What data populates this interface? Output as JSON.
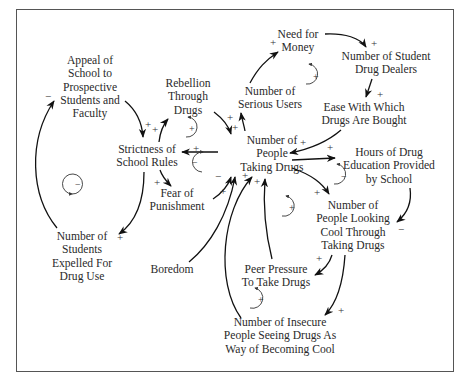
{
  "diagram": {
    "type": "causal-loop-diagram",
    "nodes": [
      {
        "id": "appeal",
        "lines": [
          "Appeal of",
          "School to",
          "Prospective",
          "Students and",
          "Faculty"
        ]
      },
      {
        "id": "strictness",
        "lines": [
          "Strictness of",
          "School Rules"
        ]
      },
      {
        "id": "rebellion",
        "lines": [
          "Rebellion",
          "Through",
          "Drugs"
        ]
      },
      {
        "id": "fear",
        "lines": [
          "Fear of",
          "Punishment"
        ]
      },
      {
        "id": "expelled",
        "lines": [
          "Number of",
          "Students",
          "Expelled For",
          "Drug Use"
        ]
      },
      {
        "id": "boredom",
        "lines": [
          "Boredom"
        ]
      },
      {
        "id": "people_taking",
        "lines": [
          "Number of",
          "People",
          "Taking Drugs"
        ]
      },
      {
        "id": "serious_users",
        "lines": [
          "Number of",
          "Serious Users"
        ]
      },
      {
        "id": "need_money",
        "lines": [
          "Need for",
          "Money"
        ]
      },
      {
        "id": "dealers",
        "lines": [
          "Number of Student",
          "Drug Dealers"
        ]
      },
      {
        "id": "ease",
        "lines": [
          "Ease With Which",
          "Drugs Are Bought"
        ]
      },
      {
        "id": "education",
        "lines": [
          "Hours of Drug",
          "Education Provided",
          "by School"
        ]
      },
      {
        "id": "looking_cool",
        "lines": [
          "Number of",
          "People Looking",
          "Cool Through",
          "Taking Drugs"
        ]
      },
      {
        "id": "peer_pressure",
        "lines": [
          "Peer Pressure",
          "To Take Drugs"
        ]
      },
      {
        "id": "insecure",
        "lines": [
          "Number of Insecure",
          "People Seeing Drugs As",
          "Way of Becoming Cool"
        ]
      }
    ],
    "edges": [
      {
        "from": "appeal",
        "to": "strictness",
        "sign": "+"
      },
      {
        "from": "strictness",
        "to": "expelled",
        "sign": "+"
      },
      {
        "from": "expelled",
        "to": "appeal",
        "sign": "−"
      },
      {
        "from": "strictness",
        "to": "rebellion",
        "sign": "+"
      },
      {
        "from": "rebellion",
        "to": "people_taking",
        "sign": "+"
      },
      {
        "from": "people_taking",
        "to": "strictness",
        "sign": "+"
      },
      {
        "from": "strictness",
        "to": "fear",
        "sign": "+"
      },
      {
        "from": "fear",
        "to": "people_taking",
        "sign": "−"
      },
      {
        "from": "boredom",
        "to": "people_taking",
        "sign": "+"
      },
      {
        "from": "people_taking",
        "to": "serious_users",
        "sign": "+"
      },
      {
        "from": "serious_users",
        "to": "need_money",
        "sign": "+"
      },
      {
        "from": "need_money",
        "to": "dealers",
        "sign": "+"
      },
      {
        "from": "dealers",
        "to": "ease",
        "sign": "+"
      },
      {
        "from": "ease",
        "to": "people_taking",
        "sign": "+"
      },
      {
        "from": "people_taking",
        "to": "education",
        "sign": "+"
      },
      {
        "from": "education",
        "to": "looking_cool",
        "sign": "−"
      },
      {
        "from": "people_taking",
        "to": "looking_cool",
        "sign": "+"
      },
      {
        "from": "looking_cool",
        "to": "peer_pressure",
        "sign": "+"
      },
      {
        "from": "peer_pressure",
        "to": "people_taking",
        "sign": "+"
      },
      {
        "from": "looking_cool",
        "to": "insecure",
        "sign": "+"
      },
      {
        "from": "insecure",
        "to": "people_taking",
        "sign": "+"
      }
    ],
    "loops": [
      {
        "id": "expulsion-loop",
        "polarity": "−"
      },
      {
        "id": "rebellion-loop",
        "polarity": "+"
      },
      {
        "id": "fear-loop",
        "polarity": "−"
      },
      {
        "id": "dealers-loop",
        "polarity": "+"
      },
      {
        "id": "education-loop",
        "polarity": "−"
      },
      {
        "id": "peer-loop",
        "polarity": "+"
      },
      {
        "id": "insecure-loop",
        "polarity": "+"
      }
    ]
  },
  "labels": {
    "appeal": [
      "Appeal of",
      "School to",
      "Prospective",
      "Students and",
      "Faculty"
    ],
    "strictness": [
      "Strictness of",
      "School Rules"
    ],
    "rebellion": [
      "Rebellion",
      "Through",
      "Drugs"
    ],
    "fear": [
      "Fear of",
      "Punishment"
    ],
    "expelled": [
      "Number of",
      "Students",
      "Expelled For",
      "Drug Use"
    ],
    "boredom": "Boredom",
    "people_taking": [
      "Number of",
      "People",
      "Taking Drugs"
    ],
    "serious_users": [
      "Number of",
      "Serious Users"
    ],
    "need_money": [
      "Need for",
      "Money"
    ],
    "dealers": [
      "Number of Student",
      "Drug Dealers"
    ],
    "ease": [
      "Ease With Which",
      "Drugs Are Bought"
    ],
    "education": [
      "Hours of Drug",
      "Education Provided",
      "by School"
    ],
    "looking_cool": [
      "Number of",
      "People Looking",
      "Cool Through",
      "Taking Drugs"
    ],
    "peer_pressure": [
      "Peer Pressure",
      "To Take Drugs"
    ],
    "insecure": [
      "Number of Insecure",
      "People Seeing Drugs As",
      "Way of Becoming Cool"
    ]
  },
  "signs": {
    "plus": "+",
    "minus": "−"
  }
}
